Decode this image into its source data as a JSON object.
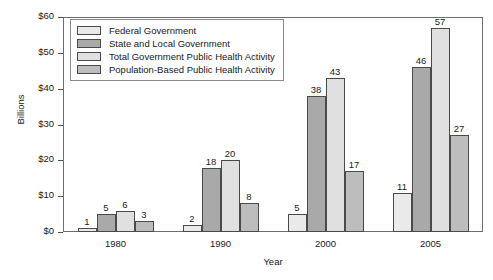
{
  "chart_data": {
    "type": "bar",
    "title": "",
    "xlabel": "Year",
    "ylabel": "Billions",
    "categories": [
      "1980",
      "1990",
      "2000",
      "2005"
    ],
    "series": [
      {
        "name": "Federal Government",
        "color": "#eaeaea",
        "values": [
          1,
          2,
          5,
          11
        ]
      },
      {
        "name": "State and Local Government",
        "color": "#a9a9a9",
        "values": [
          5,
          18,
          38,
          46
        ]
      },
      {
        "name": "Total Government Public Health Activity",
        "color": "#e0e0e0",
        "values": [
          6,
          20,
          43,
          57
        ]
      },
      {
        "name": "Population-Based Public Health Activity",
        "color": "#bdbdbd",
        "values": [
          3,
          8,
          17,
          27
        ]
      }
    ],
    "ylim": [
      0,
      60
    ],
    "ytick_values": [
      0,
      10,
      20,
      30,
      40,
      50,
      60
    ],
    "ytick_labels": [
      "$0",
      "$10",
      "$20",
      "$30",
      "$40",
      "$50",
      "$60"
    ],
    "grid": false,
    "legend_position": "top-left",
    "value_labels": true,
    "axis_color": "#6e6e6e",
    "bar_border_color": "#4a4a4a"
  }
}
